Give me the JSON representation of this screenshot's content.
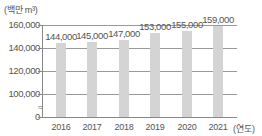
{
  "chart_data": {
    "type": "bar",
    "title": "",
    "ylabel": "(백만 m³)",
    "xlabel": "(연도)",
    "categories": [
      "2016",
      "2017",
      "2018",
      "2019",
      "2020",
      "2021"
    ],
    "values": [
      144000,
      145000,
      147000,
      153000,
      155000,
      159000
    ],
    "value_labels": [
      "144,000",
      "145,000",
      "147,000",
      "153,000",
      "155,000",
      "159,000"
    ],
    "yticks": [
      "0",
      "100,000",
      "120,000",
      "140,000",
      "160,000"
    ],
    "ylim": [
      100000,
      160000
    ],
    "axis_break": "between 0 and 100,000",
    "grid": true,
    "legend": null,
    "bar_color": "#d4d4d4"
  }
}
